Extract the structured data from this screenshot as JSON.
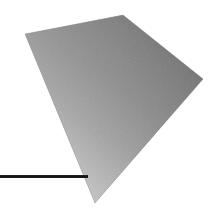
{
  "canvas": {
    "width": 219,
    "height": 216,
    "background_color": "#ffffff"
  },
  "figure": {
    "name": "shaded-quadrilateral",
    "kind": "polygon",
    "vertices": [
      {
        "label": "left-vertex",
        "x": 25,
        "y": 34
      },
      {
        "label": "top-vertex",
        "x": 123,
        "y": 15
      },
      {
        "label": "right-vertex",
        "x": 203,
        "y": 79
      },
      {
        "label": "bottom-vertex",
        "x": 95,
        "y": 203
      }
    ],
    "points_attr": "25,34 123,15 203,79 95,203",
    "fill_gradient": {
      "type": "linear",
      "x1": "88%",
      "y1": "6%",
      "x2": "24%",
      "y2": "98%",
      "stops": [
        {
          "offset": "0%",
          "color": "#646464"
        },
        {
          "offset": "18%",
          "color": "#787878"
        },
        {
          "offset": "42%",
          "color": "#8e8e8e"
        },
        {
          "offset": "64%",
          "color": "#a8a8a8"
        },
        {
          "offset": "84%",
          "color": "#c8c8c8"
        },
        {
          "offset": "100%",
          "color": "#e0e0e0"
        }
      ]
    },
    "secondary_gradient": {
      "type": "linear",
      "x1": "4%",
      "y1": "12%",
      "x2": "96%",
      "y2": "64%",
      "stops": [
        {
          "offset": "0%",
          "color": "#b4b4b4"
        },
        {
          "offset": "46%",
          "color": "#9a9a9a"
        },
        {
          "offset": "100%",
          "color": "#6c6c6c"
        }
      ]
    },
    "texture": {
      "kind": "speckle-noise",
      "opacity": 0.16,
      "grain": "fine"
    }
  },
  "baseline": {
    "name": "horizontal-rule",
    "color": "#141414",
    "highlight_color": "#3c3c3c",
    "x_start": 0,
    "x_end": 88,
    "y": 176,
    "thickness": 3
  }
}
